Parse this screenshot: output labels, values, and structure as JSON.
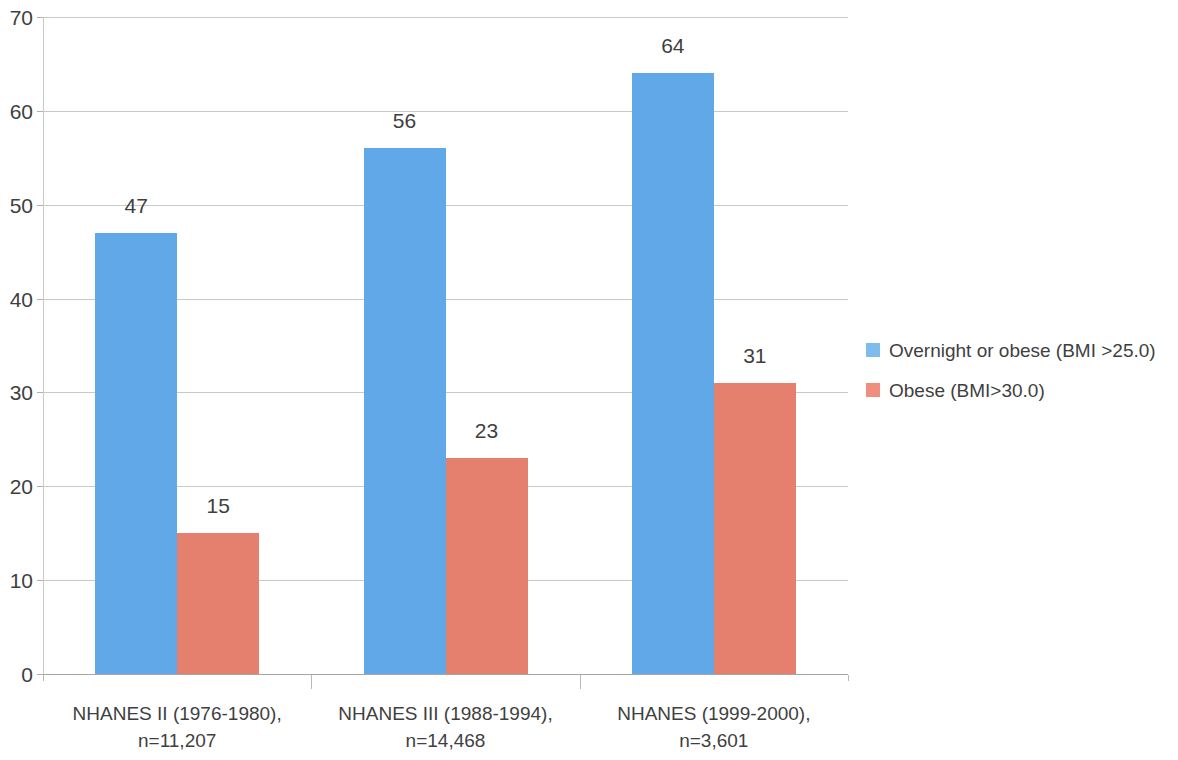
{
  "chart_data": {
    "type": "bar",
    "title": "",
    "subtitle": "",
    "xlabel": "",
    "ylabel": "",
    "ylim": [
      0,
      70
    ],
    "ytick_step": 10,
    "yticks": [
      "0",
      "10",
      "20",
      "30",
      "40",
      "50",
      "60",
      "70"
    ],
    "grid": true,
    "legend_position": "right",
    "grouped": true,
    "categories": [
      "NHANES II (1976-1980), n=11,207",
      "NHANES III (1988-1994), n=14,468",
      "NHANES (1999-2000), n=3,601"
    ],
    "category_lines": [
      [
        "NHANES II (1976-1980),",
        "n=11,207"
      ],
      [
        "NHANES III (1988-1994),",
        "n=14,468"
      ],
      [
        "NHANES (1999-2000),",
        "n=3,601"
      ]
    ],
    "series": [
      {
        "name": "Overnight or obese (BMI >25.0)",
        "color": "#61A8E8",
        "legend_color": "#7FBCEE",
        "values": [
          47,
          56,
          64
        ],
        "labels": [
          "47",
          "56",
          "64"
        ]
      },
      {
        "name": "Obese (BMI>30.0)",
        "color": "#E5806F",
        "legend_color": "#EE8F80",
        "values": [
          15,
          23,
          31
        ],
        "labels": [
          "15",
          "23",
          "31"
        ]
      }
    ]
  },
  "legend": {
    "items": [
      {
        "label": "Overnight or obese (BMI >25.0)"
      },
      {
        "label": "Obese (BMI>30.0)"
      }
    ]
  },
  "colors": {
    "series_blue": "#61A8E8",
    "series_red": "#E5806F",
    "gridline": "#c9c9c9",
    "text": "#3f3f3f",
    "background": "#ffffff"
  }
}
